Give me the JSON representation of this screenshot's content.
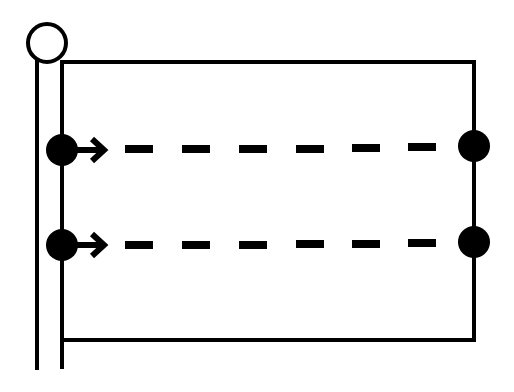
{
  "diagram": {
    "title": "",
    "colors": {
      "stroke": "#000000",
      "background": "#ffffff",
      "fill": "#000000"
    },
    "pole": {
      "left_x": 37,
      "right_x": 62,
      "top_y": 60,
      "bottom_y": 370,
      "finial": {
        "cx": 47,
        "cy": 43,
        "r": 19
      }
    },
    "flag": {
      "x1": 62,
      "y1": 62,
      "x2": 474,
      "y2": 340
    },
    "rows": [
      {
        "y": 149,
        "left_dot": {
          "cx": 62,
          "r": 16
        },
        "right_dot": {
          "cx": 474,
          "r": 16
        },
        "arrow_label": "right-arrow",
        "dash_count": 6
      },
      {
        "y": 244,
        "left_dot": {
          "cx": 62,
          "r": 16
        },
        "right_dot": {
          "cx": 474,
          "r": 16
        },
        "arrow_label": "right-arrow",
        "dash_count": 6
      }
    ],
    "dashes": {
      "start_x": 125,
      "width": 28,
      "height": 8,
      "pitch": 57
    }
  }
}
